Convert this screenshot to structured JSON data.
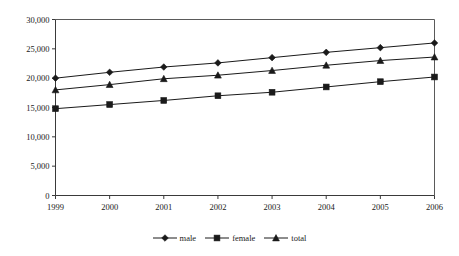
{
  "chart_data": {
    "type": "line",
    "title": "",
    "xlabel": "",
    "ylabel": "",
    "categories": [
      "1999",
      "2000",
      "2001",
      "2002",
      "2003",
      "2004",
      "2005",
      "2006"
    ],
    "series": [
      {
        "name": "male",
        "marker": "diamond",
        "values": [
          20000,
          21000,
          21900,
          22600,
          23500,
          24400,
          25200,
          26000
        ]
      },
      {
        "name": "female",
        "marker": "square",
        "values": [
          14800,
          15500,
          16200,
          17000,
          17600,
          18500,
          19400,
          20200
        ]
      },
      {
        "name": "total",
        "marker": "triangle",
        "values": [
          18000,
          18900,
          19900,
          20500,
          21300,
          22200,
          23000,
          23600
        ]
      }
    ],
    "ylim": [
      0,
      30000
    ],
    "ytick_values": [
      0,
      5000,
      10000,
      15000,
      20000,
      25000,
      30000
    ],
    "ytick_labels": [
      "0",
      "5,000",
      "10,000",
      "15,000",
      "20,000",
      "25,000",
      "30,000"
    ],
    "xtick_labels": [
      "1999",
      "2000",
      "2001",
      "2002",
      "2003",
      "2004",
      "2005",
      "2006"
    ],
    "grid": false,
    "legend_position": "bottom",
    "colors": {
      "line": "#1a1a1a",
      "marker": "#1a1a1a",
      "axis": "#3a3a3a",
      "frame": "#5a5a5a",
      "text": "#1a1a1a",
      "background": "#ffffff"
    }
  },
  "legend": {
    "items": [
      {
        "label": "male",
        "marker": "diamond-marker-icon"
      },
      {
        "label": "female",
        "marker": "square-marker-icon"
      },
      {
        "label": "total",
        "marker": "triangle-marker-icon"
      }
    ]
  }
}
